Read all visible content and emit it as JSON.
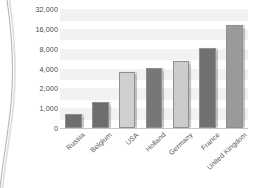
{
  "figure": {
    "background": "#ffffff",
    "page_edge_visible": true,
    "page_edge_color": "#b9b9b9"
  },
  "axis": {
    "tick_label_color": "#4a4a4a",
    "band_color": "#f2f2f2",
    "baseline_color": "#c8c8c8",
    "bar_outline_color": "#8f8f8f"
  },
  "chart_data": {
    "type": "bar",
    "title": "",
    "xlabel": "",
    "ylabel": "",
    "categories": [
      "Russia",
      "Belgium",
      "USA",
      "Holland",
      "Germany",
      "France",
      "United Kingdom"
    ],
    "values": [
      700,
      1300,
      3600,
      4100,
      5600,
      8200,
      19000
    ],
    "colors": [
      "#6e6e6e",
      "#6e6e6e",
      "#d0d0d0",
      "#777777",
      "#cccccc",
      "#707070",
      "#9a9a9a"
    ],
    "ytick_labels": [
      "0",
      "1,000",
      "2,000",
      "4,000",
      "8,000",
      "16,000",
      "32,000"
    ],
    "ytick_values": [
      0,
      1000,
      2000,
      4000,
      8000,
      16000,
      32000
    ],
    "yscale": "log-like-even-spacing",
    "ylim": [
      0,
      32000
    ],
    "grid": "horizontal-bands",
    "legend": "none",
    "xtick_rotation": -43
  }
}
